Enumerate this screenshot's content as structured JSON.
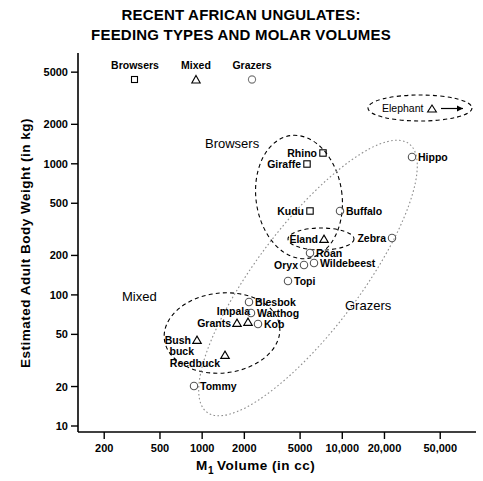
{
  "title": {
    "line1": "RECENT AFRICAN UNGULATES:",
    "line2": "FEEDING TYPES AND MOLAR VOLUMES"
  },
  "legend": {
    "position": "top-inside",
    "entries": [
      {
        "label": "Browsers",
        "marker": "square"
      },
      {
        "label": "Mixed",
        "marker": "triangle"
      },
      {
        "label": "Grazers",
        "marker": "circle"
      }
    ]
  },
  "axes": {
    "x": {
      "label_main": "M",
      "label_sub": "1",
      "label_rest": "Volume (in cc)",
      "scale": "log",
      "ticks": [
        "200",
        "500",
        "1000",
        "2000",
        "5000",
        "10,000",
        "20,000",
        "50,000"
      ],
      "tick_values": [
        200,
        500,
        1000,
        2000,
        5000,
        10000,
        20000,
        50000
      ],
      "range": [
        130,
        90000
      ]
    },
    "y": {
      "label": "Estimated Adult Body Weight (in kg)",
      "scale": "log",
      "ticks": [
        "10",
        "20",
        "50",
        "100",
        "200",
        "500",
        "1000",
        "2000",
        "5000"
      ],
      "tick_values": [
        10,
        20,
        50,
        100,
        200,
        500,
        1000,
        2000,
        5000
      ],
      "range": [
        9,
        7000
      ]
    }
  },
  "group_labels": [
    {
      "text": "Browsers",
      "x": 205,
      "y": 148
    },
    {
      "text": "Mixed",
      "x": 122,
      "y": 301
    },
    {
      "text": "Grazers",
      "x": 345,
      "y": 310
    }
  ],
  "callout": {
    "label": "Elephant",
    "marker": "triangle",
    "arrow": "right"
  },
  "chart_data": {
    "type": "scatter",
    "title": "RECENT AFRICAN UNGULATES: FEEDING TYPES AND MOLAR VOLUMES",
    "xlabel": "M1 Volume (in cc)",
    "ylabel": "Estimated Adult Body Weight (in kg)",
    "xscale": "log",
    "yscale": "log",
    "xlim": [
      130,
      90000
    ],
    "ylim": [
      9,
      7000
    ],
    "grid": false,
    "legend_position": "top-inside",
    "series": [
      {
        "name": "Browsers",
        "marker": "square",
        "points": [
          {
            "label": "Rhino",
            "x": 9000,
            "y": 1500,
            "px": 323,
            "py": 153,
            "label_side": "left"
          },
          {
            "label": "Giraffe",
            "x": 7000,
            "y": 1100,
            "px": 307,
            "py": 164,
            "label_side": "left"
          },
          {
            "label": "Kudu",
            "x": 7200,
            "y": 620,
            "px": 310,
            "py": 211,
            "label_side": "left"
          }
        ]
      },
      {
        "name": "Mixed",
        "marker": "triangle",
        "points": [
          {
            "label": "Elephant",
            "x": 90000,
            "y": 3000,
            "px": 470,
            "py": 110,
            "label_side": "callout"
          },
          {
            "label": "Eland",
            "x": 8200,
            "y": 380,
            "px": 324,
            "py": 239,
            "label_side": "left"
          },
          {
            "label": "Impala",
            "x": 2600,
            "y": 78,
            "px": 248,
            "py": 322,
            "label_side": "above"
          },
          {
            "label": "Grants",
            "x": 2300,
            "y": 78,
            "px": 237,
            "py": 323,
            "label_side": "left"
          },
          {
            "label": "Bushbuck",
            "x": 1450,
            "y": 56,
            "px": 197,
            "py": 340,
            "label_side": "left"
          },
          {
            "label": "Reedbuck",
            "x": 2000,
            "y": 40,
            "px": 225,
            "py": 355,
            "label_side": "below"
          }
        ]
      },
      {
        "name": "Grazers",
        "marker": "circle",
        "points": [
          {
            "label": "Hippo",
            "x": 47000,
            "y": 1350,
            "px": 412,
            "py": 157,
            "label_side": "right"
          },
          {
            "label": "Buffalo",
            "x": 11500,
            "y": 620,
            "px": 340,
            "py": 211,
            "label_side": "right"
          },
          {
            "label": "Zebra",
            "x": 22000,
            "y": 350,
            "px": 392,
            "py": 238,
            "label_side": "left"
          },
          {
            "label": "Roan",
            "x": 7000,
            "y": 290,
            "px": 310,
            "py": 253,
            "label_side": "right"
          },
          {
            "label": "Wildebeest",
            "x": 7400,
            "y": 230,
            "px": 314,
            "py": 263,
            "label_side": "right"
          },
          {
            "label": "Oryx",
            "x": 6300,
            "y": 225,
            "px": 304,
            "py": 265,
            "label_side": "left"
          },
          {
            "label": "Topi",
            "x": 4700,
            "y": 165,
            "px": 288,
            "py": 281,
            "label_side": "right"
          },
          {
            "label": "Blesbok",
            "x": 2900,
            "y": 110,
            "px": 249,
            "py": 302,
            "label_side": "right"
          },
          {
            "label": "Warthog",
            "x": 3000,
            "y": 90,
            "px": 251,
            "py": 313,
            "label_side": "right"
          },
          {
            "label": "Kob",
            "x": 3300,
            "y": 72,
            "px": 258,
            "py": 324,
            "label_side": "right"
          },
          {
            "label": "Tommy",
            "x": 1350,
            "y": 21,
            "px": 194,
            "py": 386,
            "label_side": "right"
          }
        ]
      }
    ]
  }
}
